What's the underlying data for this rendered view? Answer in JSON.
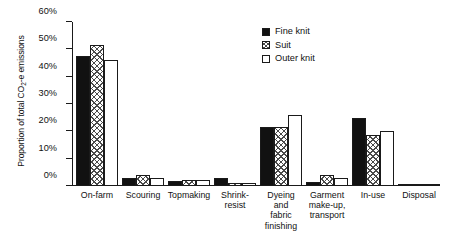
{
  "chart_data": {
    "type": "bar",
    "title": "",
    "xlabel": "",
    "ylabel": "Proportion of total CO2-e emissions",
    "ylabel_prefix": "Proportion of total CO",
    "ylabel_sub": "2",
    "ylabel_suffix": "-e emissions",
    "ylim": [
      0,
      60
    ],
    "ytick_labels": [
      "0%",
      "10%",
      "20%",
      "30%",
      "40%",
      "50%",
      "60%"
    ],
    "ytick_values": [
      0,
      10,
      20,
      30,
      40,
      50,
      60
    ],
    "grid": false,
    "legend_position": "top-right",
    "categories": [
      "On-farm",
      "Scouring",
      "Topmaking",
      "Shrink-resist",
      "Dyeing and fabric finishing",
      "Garment make-up, transport",
      "In-use",
      "Disposal"
    ],
    "category_lines": [
      [
        "On-farm"
      ],
      [
        "Scouring"
      ],
      [
        "Topmaking"
      ],
      [
        "Shrink-",
        "resist"
      ],
      [
        "Dyeing",
        "and",
        "fabric",
        "finishing"
      ],
      [
        "Garment",
        "make-up,",
        "transport"
      ],
      [
        "In-use"
      ],
      [
        "Disposal"
      ]
    ],
    "series": [
      {
        "name": "Fine knit",
        "pattern": "solid-black",
        "values": [
          47.5,
          3.0,
          2.0,
          3.0,
          21.5,
          1.5,
          25.0,
          0.5
        ]
      },
      {
        "name": "Suit",
        "pattern": "cross-hatch",
        "values": [
          51.5,
          4.0,
          2.2,
          1.0,
          21.5,
          4.0,
          18.5,
          0.5
        ]
      },
      {
        "name": "Outer knit",
        "pattern": "white-open",
        "values": [
          46.0,
          3.0,
          2.2,
          1.2,
          26.0,
          3.0,
          20.0,
          0.5
        ]
      }
    ]
  },
  "legend": {
    "items": [
      {
        "label": "Fine knit",
        "pattern": "solid-black"
      },
      {
        "label": "Suit",
        "pattern": "cross-hatch"
      },
      {
        "label": "Outer knit",
        "pattern": "white-open"
      }
    ]
  },
  "colors": {
    "fine_knit": "#111111",
    "suit_hatch": "#4a4a4a",
    "outer_knit": "#ffffff",
    "axis": "#1a1a1a",
    "background": "#ffffff"
  }
}
